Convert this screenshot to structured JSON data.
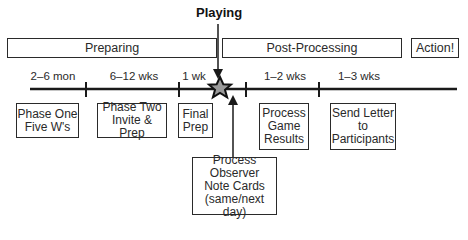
{
  "title": "Playing",
  "phases": [
    {
      "label": "Preparing"
    },
    {
      "label": "Post-Processing"
    },
    {
      "label": "Action!"
    }
  ],
  "durations": [
    "2–6 mon",
    "6–12 wks",
    "1 wk",
    "1–2 wks",
    "1–3 wks"
  ],
  "steps": [
    {
      "label": "Phase One\nFive W's"
    },
    {
      "label": "Phase Two\nInvite & Prep"
    },
    {
      "label": "Final\nPrep"
    },
    {
      "label": "Process\nGame\nResults"
    },
    {
      "label": "Send Letter\nto\nParticipants"
    },
    {
      "label": "Process\nObserver\nNote Cards\n(same/next day)"
    }
  ],
  "colors": {
    "line": "#1a1a1a",
    "star_fill": "#9a9a9a",
    "star_stroke": "#111111"
  }
}
